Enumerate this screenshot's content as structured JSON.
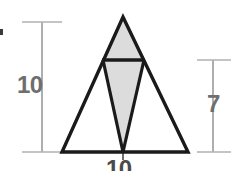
{
  "figure": {
    "background_color": "#ffffff",
    "outline_color": "#1a1a1a",
    "shade_color": "#dcdcdc",
    "shade_stroke_color": "#1a1a1a",
    "dimension_line_color": "#9a9a9a",
    "label_color": "#6e6e6e",
    "base_label_color": "#4a4a4a"
  },
  "labels": {
    "height_left": "10",
    "height_right": "7",
    "base_bottom": "10"
  },
  "dimensions": {
    "left_measure": {
      "name": "overall-height",
      "value": "10",
      "orientation": "vertical"
    },
    "right_measure": {
      "name": "partial-height",
      "value": "7",
      "orientation": "vertical"
    },
    "bottom_measure": {
      "name": "base-width",
      "value": "10",
      "orientation": "horizontal"
    }
  },
  "geometry": {
    "outer_triangle": {
      "apex": [
        123,
        17
      ],
      "bottom_left": [
        62,
        152
      ],
      "bottom_right": [
        188,
        152
      ]
    },
    "crossbar": {
      "left": [
        103,
        60
      ],
      "right": [
        144,
        60
      ]
    },
    "inner_apex_bottom": [
      123,
      152
    ],
    "shaded_upper_triangle": [
      [
        123,
        17
      ],
      [
        103,
        60
      ],
      [
        144,
        60
      ]
    ],
    "shaded_lower_triangle": [
      [
        103,
        60
      ],
      [
        144,
        60
      ],
      [
        123,
        152
      ]
    ]
  },
  "dimension_geometry": {
    "left_line": {
      "x": 42,
      "y_top": 22,
      "y_bottom": 152,
      "tick_half": 20
    },
    "right_line": {
      "x": 213,
      "y_top": 60,
      "y_bottom": 152,
      "tick_half": 16
    },
    "bottom_line": {
      "y": 156,
      "x_left": 62,
      "x_right": 188,
      "tick_center_x": 123
    }
  }
}
